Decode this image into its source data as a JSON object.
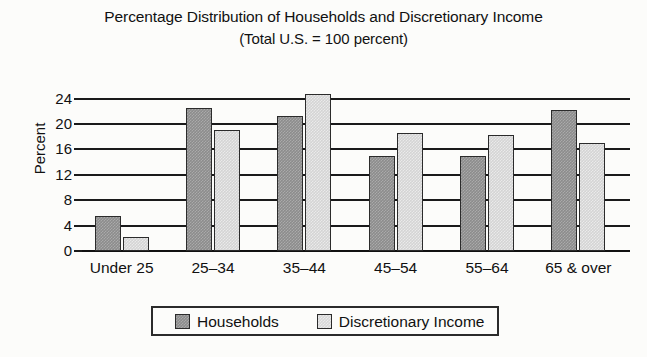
{
  "chart_data": {
    "type": "bar",
    "title": "Percentage Distribution of Households and Discretionary Income",
    "subtitle": "(Total U.S. = 100 percent)",
    "xlabel": "",
    "ylabel": "Percent",
    "ylim": [
      0,
      26
    ],
    "yticks": [
      0,
      4,
      8,
      12,
      16,
      20,
      24
    ],
    "ytick_labels": [
      "0",
      "4",
      "8",
      "12",
      "16",
      "20",
      "24"
    ],
    "grid": true,
    "legend_position": "bottom",
    "categories": [
      "Under 25",
      "25–34",
      "35–44",
      "45–54",
      "55–64",
      "65 & over"
    ],
    "series": [
      {
        "name": "Households",
        "color": "#8c8c8c",
        "values": [
          5.5,
          22.6,
          21.3,
          15.0,
          15.0,
          22.2
        ]
      },
      {
        "name": "Discretionary Income",
        "color": "#d4d4d4",
        "values": [
          2.2,
          19.1,
          24.8,
          18.6,
          18.3,
          17.0
        ]
      }
    ]
  },
  "legend": {
    "entries": [
      {
        "label": "Households"
      },
      {
        "label": "Discretionary Income"
      }
    ]
  }
}
